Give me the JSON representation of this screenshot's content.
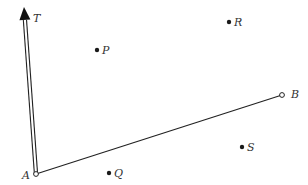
{
  "diagram": {
    "type": "geometry",
    "colors": {
      "stroke": "#222222",
      "point": "#1a1a1a",
      "label": "#333333",
      "background": "#ffffff"
    },
    "ray": {
      "name": "AT",
      "label": "T",
      "style": "double-line with filled arrowhead",
      "from": {
        "x": 36,
        "y": 174
      },
      "tip": {
        "x": 24,
        "y": 7
      }
    },
    "segment": {
      "name": "AB",
      "from_label": "A",
      "to_label": "B",
      "from": {
        "x": 36,
        "y": 174
      },
      "to": {
        "x": 282,
        "y": 95
      }
    },
    "endpoints": [
      {
        "label": "A",
        "x": 36,
        "y": 174,
        "style": "open-circle",
        "label_x": 22,
        "label_y": 179
      },
      {
        "label": "B",
        "x": 282,
        "y": 95,
        "style": "open-circle",
        "label_x": 291,
        "label_y": 98
      }
    ],
    "points": [
      {
        "label": "P",
        "x": 97,
        "y": 50,
        "label_x": 102,
        "label_y": 54
      },
      {
        "label": "R",
        "x": 229,
        "y": 22,
        "label_x": 234,
        "label_y": 26
      },
      {
        "label": "S",
        "x": 242,
        "y": 147,
        "label_x": 247,
        "label_y": 151
      },
      {
        "label": "Q",
        "x": 109,
        "y": 173,
        "label_x": 114,
        "label_y": 177
      }
    ],
    "ray_label": {
      "text": "T",
      "x": 33,
      "y": 22
    }
  }
}
